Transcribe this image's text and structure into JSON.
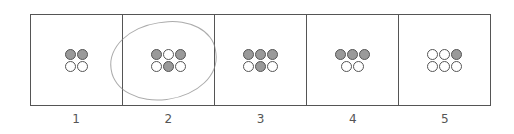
{
  "diagram": {
    "colors": {
      "filled": "#9a9a9a",
      "empty": "#ffffff",
      "stroke": "#555555"
    },
    "cells": [
      {
        "label": "1",
        "rows": [
          [
            1,
            1
          ],
          [
            0,
            0
          ]
        ]
      },
      {
        "label": "2",
        "rows": [
          [
            1,
            0,
            1
          ],
          [
            0,
            1,
            0
          ]
        ],
        "circled": true
      },
      {
        "label": "3",
        "rows": [
          [
            1,
            1,
            1
          ],
          [
            0,
            1,
            0
          ]
        ]
      },
      {
        "label": "4",
        "rows": [
          [
            1,
            1,
            1
          ],
          [
            0,
            0
          ]
        ]
      },
      {
        "label": "5",
        "rows": [
          [
            0,
            0,
            1
          ],
          [
            0,
            0,
            0
          ]
        ]
      }
    ]
  }
}
